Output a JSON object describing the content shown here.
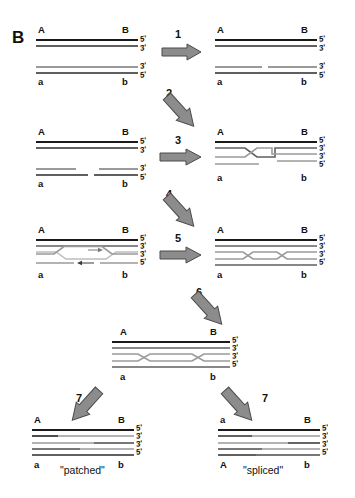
{
  "figure": {
    "panel_label": "B"
  },
  "locus_labels": {
    "A_upper": "A",
    "B_upper": "B",
    "a_lower": "a",
    "b_lower": "b",
    "a_upper": "a",
    "A_lower": "A"
  },
  "end_labels": {
    "five_prime": "5'",
    "three_prime": "3'"
  },
  "steps": [
    {
      "number": "1",
      "direction": "right"
    },
    {
      "number": "2",
      "direction": "down-right"
    },
    {
      "number": "3",
      "direction": "right"
    },
    {
      "number": "4",
      "direction": "down-right"
    },
    {
      "number": "5",
      "direction": "right"
    },
    {
      "number": "6",
      "direction": "down-right"
    },
    {
      "number": "7",
      "direction": "down-left"
    },
    {
      "number": "7",
      "direction": "down-right"
    }
  ],
  "stages": [
    {
      "id": "stage-1-parental-duplexes",
      "caption": "",
      "top_left": "A",
      "top_right": "B",
      "bottom_left": "a",
      "bottom_right": "b",
      "ends_upper": [
        "5'",
        "3'"
      ],
      "ends_lower": [
        "3'",
        "5'"
      ]
    },
    {
      "id": "stage-2-nicked-duplex",
      "caption": "",
      "top_left": "A",
      "top_right": "B",
      "bottom_left": "a",
      "bottom_right": "b",
      "ends_upper": [
        "5'",
        "3'"
      ],
      "ends_lower": [
        "3'",
        "5'"
      ]
    },
    {
      "id": "stage-3-gapped-duplex",
      "caption": "",
      "top_left": "A",
      "top_right": "B",
      "bottom_left": "a",
      "bottom_right": "b",
      "ends_upper": [
        "5'",
        "3'"
      ],
      "ends_lower": [
        "3'",
        "5'"
      ]
    },
    {
      "id": "stage-4-strand-invasion",
      "caption": "",
      "top_left": "A",
      "top_right": "B",
      "bottom_left": "a",
      "bottom_right": "b",
      "ends": [
        "5'",
        "3'",
        "3'",
        "5'"
      ]
    },
    {
      "id": "stage-5-dna-synthesis",
      "caption": "",
      "top_left": "A",
      "top_right": "B",
      "bottom_left": "a",
      "bottom_right": "b",
      "ends": [
        "5'",
        "3'",
        "3'",
        "5'"
      ]
    },
    {
      "id": "stage-6-double-holliday-junction",
      "caption": "",
      "top_left": "A",
      "top_right": "B",
      "bottom_left": "a",
      "bottom_right": "b",
      "ends": [
        "5'",
        "3'",
        "3'",
        "5'"
      ]
    },
    {
      "id": "stage-7-central-intermediate",
      "caption": "",
      "top_left": "A",
      "top_right": "B",
      "bottom_left": "a",
      "bottom_right": "b",
      "ends": [
        "5'",
        "3'",
        "3'",
        "5'"
      ]
    },
    {
      "id": "product-patched",
      "caption": "\"patched\"",
      "top_left": "A",
      "top_right": "B",
      "bottom_left": "a",
      "bottom_right": "b",
      "ends": [
        "5'",
        "3'",
        "3'",
        "5'"
      ]
    },
    {
      "id": "product-spliced",
      "caption": "\"spliced\"",
      "top_left": "a",
      "top_right": "B",
      "bottom_left": "A",
      "bottom_right": "b",
      "ends": [
        "5'",
        "3'",
        "3'",
        "5'"
      ]
    }
  ],
  "colors": {
    "background": "#ffffff",
    "strand_dark": "#1a1a1a",
    "strand_mid": "#5f5f5f",
    "strand_light": "#9a9a9a",
    "arrow_fill": "#8c8c8c",
    "arrow_stroke": "#4a4a4a",
    "text": "#111111"
  }
}
